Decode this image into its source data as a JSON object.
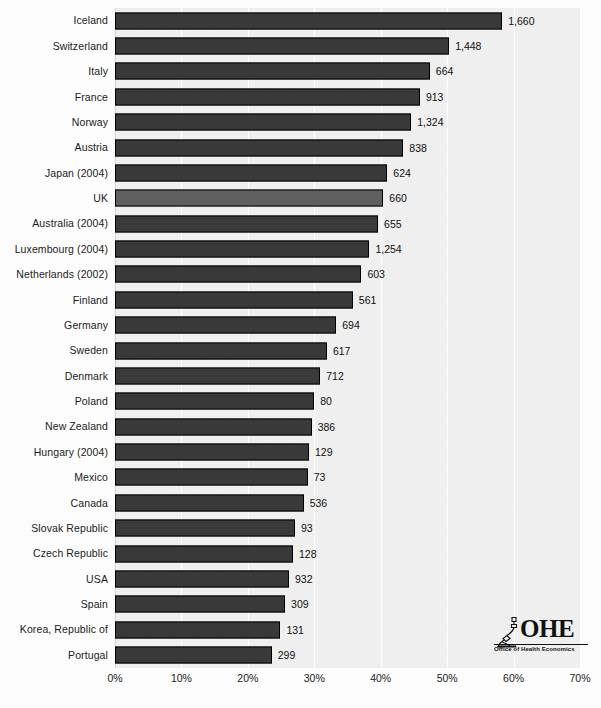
{
  "chart_data": {
    "type": "bar",
    "orientation": "horizontal",
    "title": "",
    "subtitle": "",
    "xlabel": "",
    "ylabel": "",
    "xlim": [
      0,
      70
    ],
    "xunit": "%",
    "grid": true,
    "legend": null,
    "xticks": [
      "0%",
      "10%",
      "20%",
      "30%",
      "40%",
      "50%",
      "60%",
      "70%"
    ],
    "xtick_values": [
      0,
      10,
      20,
      30,
      40,
      50,
      60,
      70
    ],
    "categories": [
      "Iceland",
      "Switzerland",
      "Italy",
      "France",
      "Norway",
      "Austria",
      "Japan (2004)",
      "UK",
      "Australia (2004)",
      "Luxembourg (2004)",
      "Netherlands (2002)",
      "Finland",
      "Germany",
      "Sweden",
      "Denmark",
      "Poland",
      "New Zealand",
      "Hungary (2004)",
      "Mexico",
      "Canada",
      "Slovak Republic",
      "Czech Republic",
      "USA",
      "Spain",
      "Korea, Republic of",
      "Portugal"
    ],
    "values": [
      58.3,
      50.3,
      47.4,
      45.9,
      44.6,
      43.4,
      41.0,
      40.4,
      39.6,
      38.3,
      37.1,
      35.8,
      33.3,
      31.9,
      30.9,
      30.0,
      29.6,
      29.2,
      29.0,
      28.4,
      27.1,
      26.8,
      26.2,
      25.6,
      24.9,
      23.6
    ],
    "data_labels": [
      "1,660",
      "1,448",
      "664",
      "913",
      "1,324",
      "838",
      "624",
      "660",
      "655",
      "1,254",
      "603",
      "561",
      "694",
      "617",
      "712",
      "80",
      "386",
      "129",
      "73",
      "536",
      "93",
      "128",
      "932",
      "309",
      "131",
      "299"
    ],
    "highlight_category": "UK",
    "colors": {
      "bar": "#3a3a3a",
      "bar_highlight": "#616161",
      "bar_border": "#000000",
      "plot_background": "#f2f2f2",
      "gridline": "#ffffff",
      "text": "#1c1c1c"
    }
  },
  "logo": {
    "name": "ohe-logo",
    "wordmark": "OHE",
    "tagline": "Office of Health Economics",
    "icon": "microscope-icon"
  }
}
